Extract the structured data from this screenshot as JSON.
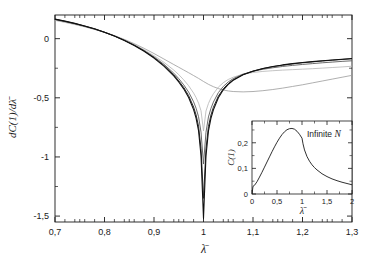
{
  "figure": {
    "background": "#ffffff",
    "frame_color": "#1a1a1a"
  },
  "chart_data": {
    "type": "line",
    "title": "",
    "xlabel": "λ̄",
    "ylabel": "dC(1)/dλ̄",
    "xlim": [
      0.7,
      1.3
    ],
    "ylim": [
      -1.55,
      0.2
    ],
    "grid": false,
    "legend": "none",
    "xticks": [
      0.7,
      0.8,
      0.9,
      1.0,
      1.1,
      1.2,
      1.3
    ],
    "xticklabels": [
      "0,7",
      "0,8",
      "0,9",
      "1",
      "1,1",
      "1,2",
      "1,3"
    ],
    "yticks": [
      0.0,
      -0.5,
      -1.0,
      -1.5
    ],
    "yticklabels": [
      "0",
      "-0,5",
      "-1",
      "-1,5"
    ],
    "x": [
      0.7,
      0.72,
      0.74,
      0.76,
      0.78,
      0.8,
      0.82,
      0.84,
      0.86,
      0.88,
      0.9,
      0.92,
      0.94,
      0.95,
      0.96,
      0.97,
      0.98,
      0.985,
      0.99,
      0.995,
      1.0,
      1.005,
      1.01,
      1.015,
      1.02,
      1.03,
      1.04,
      1.05,
      1.06,
      1.08,
      1.1,
      1.12,
      1.14,
      1.16,
      1.18,
      1.2,
      1.22,
      1.24,
      1.26,
      1.28,
      1.3
    ],
    "series": [
      {
        "name": "smallest N",
        "color": "#9a9a9a",
        "width": 0.8,
        "min_value": -0.45,
        "values": [
          0.155,
          0.138,
          0.12,
          0.1,
          0.078,
          0.054,
          0.026,
          -0.006,
          -0.042,
          -0.082,
          -0.126,
          -0.172,
          -0.219,
          -0.242,
          -0.265,
          -0.288,
          -0.312,
          -0.324,
          -0.336,
          -0.349,
          -0.362,
          -0.374,
          -0.386,
          -0.396,
          -0.406,
          -0.422,
          -0.434,
          -0.442,
          -0.447,
          -0.45,
          -0.447,
          -0.44,
          -0.43,
          -0.418,
          -0.404,
          -0.39,
          -0.374,
          -0.358,
          -0.342,
          -0.326,
          -0.31
        ]
      },
      {
        "name": "small N",
        "color": "#b5b5b5",
        "width": 0.8,
        "min_value": -0.78,
        "values": [
          0.16,
          0.143,
          0.124,
          0.103,
          0.08,
          0.054,
          0.024,
          -0.01,
          -0.05,
          -0.094,
          -0.144,
          -0.2,
          -0.266,
          -0.304,
          -0.348,
          -0.398,
          -0.46,
          -0.498,
          -0.545,
          -0.61,
          -0.78,
          -0.612,
          -0.548,
          -0.502,
          -0.466,
          -0.41,
          -0.372,
          -0.345,
          -0.326,
          -0.3,
          -0.286,
          -0.277,
          -0.271,
          -0.266,
          -0.262,
          -0.258,
          -0.254,
          -0.249,
          -0.244,
          -0.239,
          -0.233
        ]
      },
      {
        "name": "medium N",
        "color": "#5a5a5a",
        "width": 0.9,
        "min_value": -1.06,
        "values": [
          0.162,
          0.145,
          0.126,
          0.105,
          0.081,
          0.054,
          0.023,
          -0.012,
          -0.053,
          -0.1,
          -0.154,
          -0.216,
          -0.292,
          -0.338,
          -0.39,
          -0.452,
          -0.534,
          -0.588,
          -0.66,
          -0.79,
          -1.06,
          -0.792,
          -0.662,
          -0.59,
          -0.536,
          -0.456,
          -0.404,
          -0.366,
          -0.338,
          -0.3,
          -0.276,
          -0.259,
          -0.246,
          -0.235,
          -0.226,
          -0.218,
          -0.211,
          -0.204,
          -0.198,
          -0.192,
          -0.187
        ]
      },
      {
        "name": "large N",
        "color": "#2e2e2e",
        "width": 1.0,
        "min_value": -1.35,
        "values": [
          0.164,
          0.147,
          0.128,
          0.106,
          0.082,
          0.054,
          0.022,
          -0.014,
          -0.056,
          -0.104,
          -0.16,
          -0.226,
          -0.306,
          -0.356,
          -0.412,
          -0.482,
          -0.578,
          -0.644,
          -0.74,
          -0.93,
          -1.35,
          -0.932,
          -0.742,
          -0.646,
          -0.58,
          -0.486,
          -0.424,
          -0.38,
          -0.348,
          -0.304,
          -0.274,
          -0.253,
          -0.237,
          -0.224,
          -0.213,
          -0.204,
          -0.196,
          -0.189,
          -0.182,
          -0.176,
          -0.17
        ]
      },
      {
        "name": "largest N",
        "color": "#101010",
        "width": 1.1,
        "min_value": -1.52,
        "values": [
          0.165,
          0.148,
          0.129,
          0.107,
          0.083,
          0.055,
          0.022,
          -0.015,
          -0.058,
          -0.107,
          -0.164,
          -0.232,
          -0.314,
          -0.366,
          -0.424,
          -0.498,
          -0.6,
          -0.672,
          -0.778,
          -0.99,
          -1.52,
          -0.992,
          -0.78,
          -0.674,
          -0.602,
          -0.5,
          -0.432,
          -0.386,
          -0.352,
          -0.306,
          -0.275,
          -0.252,
          -0.236,
          -0.222,
          -0.211,
          -0.202,
          -0.194,
          -0.187,
          -0.18,
          -0.174,
          -0.168
        ]
      }
    ]
  },
  "inset": {
    "annotation": "Infinite N",
    "annotation_italic_part": "N",
    "chart_data": {
      "type": "line",
      "xlabel": "λ̄",
      "ylabel": "C(1)",
      "xlim": [
        0,
        2
      ],
      "ylim": [
        0,
        0.285
      ],
      "grid": false,
      "xticks": [
        0,
        0.5,
        1,
        1.5,
        2
      ],
      "xticklabels": [
        "0",
        "0,5",
        "1",
        "1,5",
        "2"
      ],
      "yticks": [
        0,
        0.1,
        0.2
      ],
      "yticklabels": [
        "0",
        "0,1",
        "0,2"
      ],
      "color": "#1a1a1a",
      "x": [
        0.0,
        0.02,
        0.05,
        0.1,
        0.15,
        0.2,
        0.25,
        0.3,
        0.35,
        0.4,
        0.45,
        0.5,
        0.55,
        0.6,
        0.65,
        0.7,
        0.75,
        0.8,
        0.85,
        0.9,
        0.95,
        1.0,
        1.02,
        1.05,
        1.1,
        1.15,
        1.2,
        1.25,
        1.3,
        1.4,
        1.5,
        1.6,
        1.7,
        1.8,
        1.9,
        2.0
      ],
      "values": [
        0.0,
        0.03,
        0.034,
        0.048,
        0.066,
        0.085,
        0.105,
        0.125,
        0.145,
        0.165,
        0.184,
        0.202,
        0.218,
        0.232,
        0.243,
        0.251,
        0.255,
        0.256,
        0.253,
        0.245,
        0.233,
        0.218,
        0.196,
        0.172,
        0.146,
        0.128,
        0.114,
        0.103,
        0.094,
        0.079,
        0.068,
        0.059,
        0.052,
        0.046,
        0.041,
        0.036
      ]
    }
  }
}
